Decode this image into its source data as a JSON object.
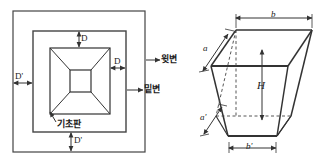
{
  "figure": {
    "title": "",
    "type": "engineering-drawing"
  },
  "plan_view": {
    "name": "plan-view",
    "labels": {
      "d_top": "D",
      "d_right": "D",
      "d_prime_left": "D'",
      "d_prime_bottom": "D'",
      "base_plate": "기초판"
    }
  },
  "side_callouts": {
    "upper_side": "윗변",
    "bottom_side": "밑변"
  },
  "iso_view": {
    "name": "isometric-view",
    "labels": {
      "b_top": "b",
      "a_left": "a",
      "h_height": "H",
      "a_prime": "a'",
      "b_prime": "b'"
    }
  },
  "colors": {
    "stroke": "#333333",
    "stroke_light": "#555555",
    "text": "#1a1a1a",
    "background": "#ffffff"
  }
}
